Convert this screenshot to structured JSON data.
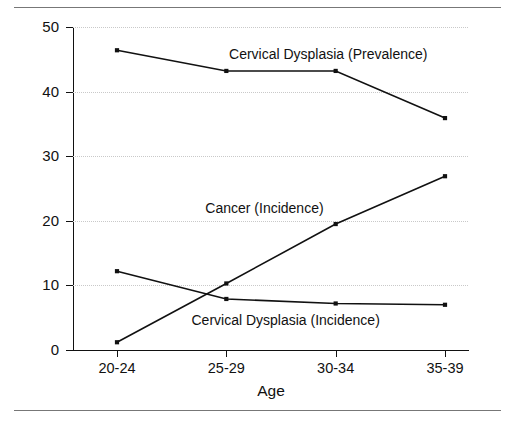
{
  "chart_data": {
    "type": "line",
    "title": "",
    "xlabel": "Age",
    "ylabel": "Rate *",
    "categories": [
      "20-24",
      "25-29",
      "30-34",
      "35-39"
    ],
    "ylim": [
      0,
      50
    ],
    "yticks": [
      0,
      10,
      20,
      30,
      40,
      50
    ],
    "ytick_labels": [
      "0",
      "10",
      "20",
      "30",
      "40",
      "50"
    ],
    "grid": true,
    "legend_position": "inline-annotations",
    "series": [
      {
        "name": "Cervical Dysplasia (Prevalence)",
        "values": [
          46.4,
          43.2,
          43.2,
          35.9
        ],
        "label_x_frac": 0.395,
        "label_y_value": 45.6
      },
      {
        "name": "Cancer (Incidence)",
        "values": [
          1.2,
          10.3,
          19.5,
          26.9
        ],
        "label_x_frac": 0.335,
        "label_y_value": 21.8
      },
      {
        "name": "Cervical Dysplasia (Incidence)",
        "values": [
          12.2,
          7.9,
          7.2,
          7.0
        ],
        "label_x_frac": 0.3,
        "label_y_value": 4.5
      }
    ]
  },
  "axes": {
    "y_title": "Rate *",
    "x_title": "Age"
  }
}
